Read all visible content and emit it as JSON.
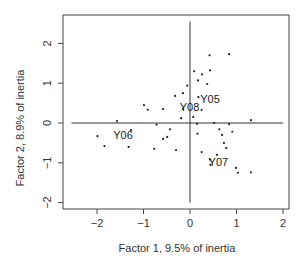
{
  "chart_data": {
    "type": "scatter",
    "title": "",
    "xlabel": "Factor 1, 9.5% of inertia",
    "ylabel": "Factor 2, 8.9% of inertia",
    "xlim": [
      -2.7,
      2.15
    ],
    "ylim": [
      -2.2,
      2.7
    ],
    "xticks": [
      -2,
      -1,
      0,
      1,
      2
    ],
    "yticks": [
      -2,
      -1,
      0,
      1,
      2
    ],
    "xtick_labels": [
      "−2",
      "−1",
      "0",
      "1",
      "2"
    ],
    "ytick_labels": [
      "−2",
      "−1",
      "0",
      "1",
      "2"
    ],
    "grid": false,
    "legend": null,
    "reference_lines": {
      "horizontal": {
        "y": 0,
        "x_from": -2.55,
        "x_to": 2.0
      },
      "vertical": {
        "x": 0,
        "y_from": -2.0,
        "y_to": 2.55
      }
    },
    "points": [
      {
        "x": 0.42,
        "y": 1.7
      },
      {
        "x": 0.84,
        "y": 1.73
      },
      {
        "x": 0.09,
        "y": 1.3
      },
      {
        "x": 0.26,
        "y": 1.22
      },
      {
        "x": 0.43,
        "y": 1.32
      },
      {
        "x": 0.17,
        "y": 1.07
      },
      {
        "x": 0.37,
        "y": 0.98
      },
      {
        "x": -0.06,
        "y": 0.94
      },
      {
        "x": -0.15,
        "y": 0.75
      },
      {
        "x": -0.32,
        "y": 0.68
      },
      {
        "x": 0.18,
        "y": 0.65
      },
      {
        "x": -0.99,
        "y": 0.45
      },
      {
        "x": -0.91,
        "y": 0.33
      },
      {
        "x": -0.58,
        "y": 0.35
      },
      {
        "x": -0.15,
        "y": 0.35
      },
      {
        "x": 0.25,
        "y": 0.33
      },
      {
        "x": -0.19,
        "y": 0.12
      },
      {
        "x": 0.07,
        "y": 0.15
      },
      {
        "x": -1.57,
        "y": 0.05
      },
      {
        "x": -0.72,
        "y": -0.04
      },
      {
        "x": 0.15,
        "y": -0.02
      },
      {
        "x": 0.52,
        "y": 0.0
      },
      {
        "x": 0.84,
        "y": -0.03
      },
      {
        "x": 1.31,
        "y": 0.07
      },
      {
        "x": -1.99,
        "y": -0.33
      },
      {
        "x": -1.84,
        "y": -0.58
      },
      {
        "x": -1.27,
        "y": -0.18
      },
      {
        "x": -1.32,
        "y": -0.6
      },
      {
        "x": -0.43,
        "y": -0.16
      },
      {
        "x": -0.49,
        "y": -0.35
      },
      {
        "x": -0.58,
        "y": -0.4
      },
      {
        "x": -0.77,
        "y": -0.65
      },
      {
        "x": -0.3,
        "y": -0.68
      },
      {
        "x": 0.16,
        "y": -0.27
      },
      {
        "x": 0.63,
        "y": -0.16
      },
      {
        "x": 0.69,
        "y": -0.3
      },
      {
        "x": 0.91,
        "y": -0.22
      },
      {
        "x": 0.73,
        "y": -0.5
      },
      {
        "x": 0.78,
        "y": -0.63
      },
      {
        "x": 0.25,
        "y": -0.73
      },
      {
        "x": 0.58,
        "y": -0.8
      },
      {
        "x": 0.43,
        "y": -0.92
      },
      {
        "x": 0.44,
        "y": -1.05
      },
      {
        "x": 0.99,
        "y": -1.13
      },
      {
        "x": 1.03,
        "y": -1.25
      },
      {
        "x": 1.31,
        "y": -1.24
      }
    ],
    "annotations": [
      {
        "text": "Y05",
        "x": 0.22,
        "y": 0.6
      },
      {
        "text": "Y08",
        "x": -0.22,
        "y": 0.4
      },
      {
        "text": "Y06",
        "x": -1.65,
        "y": -0.3
      },
      {
        "text": "Y07",
        "x": 0.4,
        "y": -0.97
      }
    ]
  }
}
